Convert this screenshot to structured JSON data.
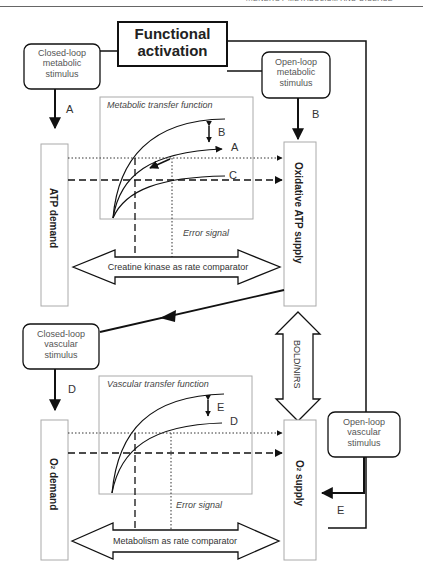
{
  "header": {
    "running_title": "...ENERGY METABOLISM AND DISEASE"
  },
  "diagram": {
    "title": "Functional activation",
    "title_line1": "Functional",
    "title_line2": "activation",
    "stimuli": {
      "closed_loop_metabolic": [
        "Closed-loop",
        "metabolic",
        "stimulus"
      ],
      "open_loop_metabolic": [
        "Open-loop",
        "metabolic",
        "stimulus"
      ],
      "closed_loop_vascular": [
        "Closed-loop",
        "vascular",
        "stimulus"
      ],
      "open_loop_vascular": [
        "Open-loop",
        "vascular",
        "stimulus"
      ]
    },
    "path_labels": {
      "A": "A",
      "B": "B",
      "D": "D",
      "E": "E"
    },
    "metabolic_panel": {
      "title": "Metabolic transfer function",
      "curve_labels": [
        "B",
        "A",
        "C"
      ],
      "error_signal": "Error signal",
      "comparator": "Creatine kinase as rate comparator",
      "demand": "ATP demand",
      "supply": "Oxidative ATP supply"
    },
    "vascular_panel": {
      "title": "Vascular transfer function",
      "curve_labels": [
        "E",
        "D"
      ],
      "error_signal": "Error signal",
      "comparator": "Metabolism as rate comparator",
      "demand_prefix": "O",
      "demand_sub": "2",
      "demand_suffix": " demand",
      "supply_prefix": "O",
      "supply_sub": "2",
      "supply_suffix": " supply"
    },
    "coupling": "BOLD/NIRS"
  }
}
